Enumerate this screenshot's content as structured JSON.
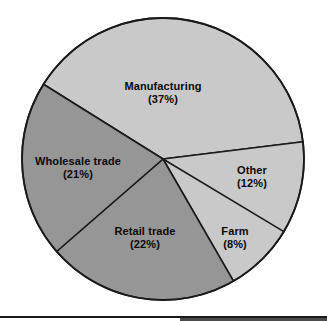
{
  "chart_data": {
    "type": "pie",
    "title": "",
    "subtitle": "",
    "xlabel": "",
    "ylabel": "",
    "legend_position": "none",
    "grid": false,
    "labels_inside": true,
    "center": [
      163,
      159
    ],
    "radius": 141,
    "slices": [
      {
        "name": "Manufacturing",
        "label": "Manufacturing",
        "percent": 37,
        "percent_label": "(37%)",
        "value": 37,
        "color": "#c9c9c9",
        "start_angle": 212,
        "end_angle": 353,
        "label_x": 163,
        "label_y": 93
      },
      {
        "name": "Other",
        "label": "Other",
        "percent": 12,
        "percent_label": "(12%)",
        "value": 12,
        "color": "#c9c9c9",
        "start_angle": 353,
        "end_angle": 396,
        "label_x": 252,
        "label_y": 177
      },
      {
        "name": "Farm",
        "label": "Farm",
        "percent": 8,
        "percent_label": "(8%)",
        "value": 8,
        "color": "#c9c9c9",
        "start_angle": 31,
        "end_angle": 60,
        "label_x": 235,
        "label_y": 238
      },
      {
        "name": "Retail trade",
        "label": "Retail trade",
        "percent": 22,
        "percent_label": "(22%)",
        "value": 22,
        "color": "#969696",
        "start_angle": 60,
        "end_angle": 139,
        "label_x": 145,
        "label_y": 238
      },
      {
        "name": "Wholesale trade",
        "label": "Wholesale trade",
        "percent": 21,
        "percent_label": "(21%)",
        "value": 21,
        "color": "#969696",
        "start_angle": 139,
        "end_angle": 212,
        "label_x": 78,
        "label_y": 168
      }
    ],
    "categories": [
      "Manufacturing",
      "Wholesale trade",
      "Retail trade",
      "Other",
      "Farm"
    ],
    "values": [
      37,
      21,
      22,
      12,
      8
    ],
    "colors": {
      "light_slice": "#c9c9c9",
      "dark_slice": "#969696",
      "outline": "#1a1a1a",
      "background": "#ffffff",
      "label_text": "#0a0a0a"
    }
  }
}
